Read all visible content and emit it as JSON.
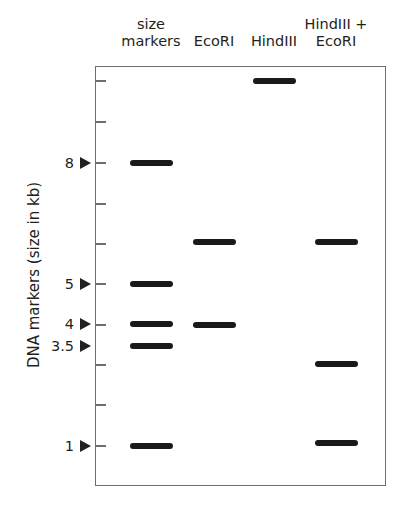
{
  "lanes": [
    {
      "label_lines": [
        "size",
        "markers"
      ],
      "center_x": 151
    },
    {
      "label_lines": [
        "EcoRI"
      ],
      "center_x": 214
    },
    {
      "label_lines": [
        "HindIII"
      ],
      "center_x": 274
    },
    {
      "label_lines": [
        "HindIII +",
        "EcoRI"
      ],
      "center_x": 336
    }
  ],
  "y_axis_title": "DNA markers (size in kb)",
  "markers": [
    {
      "label": "8",
      "y": 163
    },
    {
      "label": "5",
      "y": 284
    },
    {
      "label": "4",
      "y": 324
    },
    {
      "label": "3.5",
      "y": 346
    },
    {
      "label": "1",
      "y": 446
    }
  ],
  "ticks_y": [
    81,
    122,
    163,
    204,
    244,
    284,
    325,
    365,
    405,
    446
  ],
  "bands": [
    {
      "lane": 0,
      "x": 130,
      "y": 163,
      "size_kb": 8
    },
    {
      "lane": 0,
      "x": 130,
      "y": 284,
      "size_kb": 5
    },
    {
      "lane": 0,
      "x": 130,
      "y": 324,
      "size_kb": 4
    },
    {
      "lane": 0,
      "x": 130,
      "y": 346,
      "size_kb": 3.5
    },
    {
      "lane": 0,
      "x": 130,
      "y": 446,
      "size_kb": 1
    },
    {
      "lane": 1,
      "x": 193,
      "y": 242
    },
    {
      "lane": 1,
      "x": 193,
      "y": 325
    },
    {
      "lane": 2,
      "x": 253,
      "y": 81
    },
    {
      "lane": 3,
      "x": 315,
      "y": 242
    },
    {
      "lane": 3,
      "x": 315,
      "y": 364
    },
    {
      "lane": 3,
      "x": 315,
      "y": 443
    }
  ],
  "colors": {
    "band": "#1a1a1a",
    "frame": "#6d6e71",
    "text": "#231f20"
  }
}
